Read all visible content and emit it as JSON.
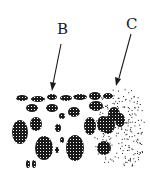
{
  "diagram": {
    "labels": [
      {
        "id": "B",
        "text": "B"
      },
      {
        "id": "C",
        "text": "C"
      }
    ],
    "colors": {
      "ink": "#1a1a1a",
      "background": "#ffffff"
    },
    "regions": [
      {
        "label": "B",
        "description": "coarse dark clustered blobs"
      },
      {
        "label": "C",
        "description": "fine dispersed stippled dots"
      }
    ]
  }
}
